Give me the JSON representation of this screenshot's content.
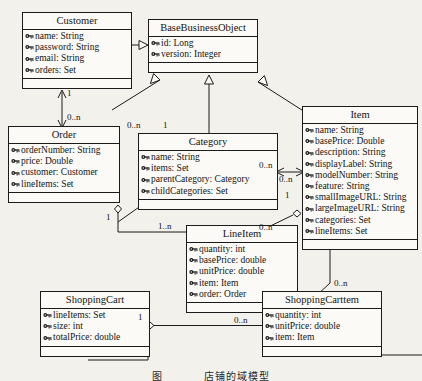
{
  "diagram": {
    "kind": "uml-class-diagram",
    "icon_name": "private-attribute-key-icon",
    "stroke_color": "#1b1b1b",
    "paper_color": "#f2f1ec",
    "box_fill": "#fbfaf6"
  },
  "classes": [
    {
      "id": "customer",
      "name": "Customer",
      "attributes": [
        "name: String",
        "password: String",
        "email: String",
        "orders: Set"
      ]
    },
    {
      "id": "basebusinessobject",
      "name": "BaseBusinessObject",
      "attributes": [
        "id: Long",
        "version: Integer"
      ]
    },
    {
      "id": "order",
      "name": "Order",
      "attributes": [
        "orderNumber: String",
        "price: Double",
        "customer: Customer",
        "lineItems: Set"
      ]
    },
    {
      "id": "category",
      "name": "Category",
      "attributes": [
        "name: String",
        "items: Set",
        "parentCategory: Category",
        "childCategories: Set"
      ]
    },
    {
      "id": "item",
      "name": "Item",
      "attributes": [
        "name: String",
        "basePrice: Double",
        "description: String",
        "displayLabel: String",
        "modelNumber: String",
        "feature: String",
        "smallImageURL: String",
        "largeImageURL: String",
        "categories: Set",
        "lineItems: Set"
      ]
    },
    {
      "id": "lineitem",
      "name": "LineItem",
      "attributes": [
        "quantity: int",
        "basePrice: double",
        "unitPrice: double",
        "item: Item",
        "order: Order"
      ]
    },
    {
      "id": "shoppingcart",
      "name": "ShoppingCart",
      "attributes": [
        "lineItems: Set",
        "size: int",
        "totalPrice: double"
      ]
    },
    {
      "id": "shoppingcartitem",
      "name": "ShoppingCarttem",
      "attributes": [
        "quantity: int",
        "unitPrice: double",
        "item: Item"
      ]
    }
  ],
  "multiplicities": [
    {
      "id": "m-customer-order-1",
      "label": "1"
    },
    {
      "id": "m-customer-order-n",
      "label": "0..n"
    },
    {
      "id": "m-category-left-n",
      "label": "0..n"
    },
    {
      "id": "m-category-top-1",
      "label": "1"
    },
    {
      "id": "m-category-item-left-n",
      "label": "0..n"
    },
    {
      "id": "m-category-item-right-n",
      "label": "0..n"
    },
    {
      "id": "m-item-lineitem-1",
      "label": "1"
    },
    {
      "id": "m-order-lineitem-1",
      "label": "1"
    },
    {
      "id": "m-order-lineitem-n",
      "label": "1..n"
    },
    {
      "id": "m-lineitem-item-n",
      "label": "0..n"
    },
    {
      "id": "m-cart-1",
      "label": "1"
    },
    {
      "id": "m-cartitem-n",
      "label": "0..n"
    },
    {
      "id": "m-item-cartitem-n",
      "label": "0..n"
    }
  ],
  "caption": {
    "number": "图",
    "text": "店铺的域模型"
  }
}
